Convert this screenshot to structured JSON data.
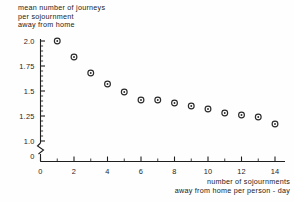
{
  "chart_data": {
    "type": "scatter",
    "title": "",
    "ylabel": "mean number of journeys per sojournment away from home",
    "ylabel_lines": [
      "mean number of journeys",
      "per sojournment",
      "away from home"
    ],
    "xlabel": "number of sojournments away from home per person - day",
    "xlabel_lines": [
      "number of sojournments",
      "away from home per  person - day"
    ],
    "x": [
      1,
      2,
      3,
      4,
      5,
      6,
      7,
      8,
      9,
      10,
      11,
      12,
      13,
      14
    ],
    "values": [
      2.0,
      1.84,
      1.68,
      1.57,
      1.49,
      1.41,
      1.41,
      1.38,
      1.35,
      1.32,
      1.28,
      1.26,
      1.24,
      1.17
    ],
    "xlim": [
      0,
      14.6
    ],
    "ylim": [
      1.0,
      2.05
    ],
    "y_axis_break": true,
    "y_axis_break_label": "0",
    "xticks": [
      0,
      2,
      4,
      6,
      8,
      10,
      12,
      14
    ],
    "xtick_labels": [
      "0",
      "2",
      "4",
      "6",
      "8",
      "10",
      "12",
      "14"
    ],
    "xminor_step": 1,
    "yticks": [
      1.0,
      1.25,
      1.5,
      1.75,
      2.0
    ],
    "ytick_labels": [
      "1.0",
      "1.25",
      "1.5",
      "1.75",
      "2.0"
    ],
    "yminor_step": 0.05,
    "grid": false,
    "legend": null,
    "marker": "open-circle-with-center-dot",
    "marker_color": "#2b2b2b"
  }
}
